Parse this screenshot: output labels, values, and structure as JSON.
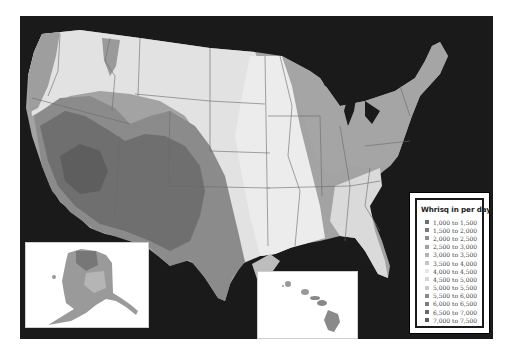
{
  "map": {
    "title": "Whrisq in per day",
    "background_color": "#1a1a1a",
    "insets": [
      {
        "name": "alaska",
        "label": ""
      },
      {
        "name": "hawaii",
        "label": ""
      }
    ]
  },
  "legend": {
    "title": "Whrisq in per day",
    "items": [
      {
        "label": "1,000 to 1,500",
        "color": "#6e6e6e"
      },
      {
        "label": "1,500 to 2,000",
        "color": "#7a7a7a"
      },
      {
        "label": "2,000 to 2,500",
        "color": "#8d8d8d"
      },
      {
        "label": "2,500 to 3,000",
        "color": "#a0a0a0"
      },
      {
        "label": "3,000 to 3,500",
        "color": "#b3b3b3"
      },
      {
        "label": "3,500 to 4,000",
        "color": "#c4c4c4"
      },
      {
        "label": "4,000 to 4,500",
        "color": "#e6e6e6"
      },
      {
        "label": "4,500 to 5,000",
        "color": "#d6d6d6"
      },
      {
        "label": "5,000 to 5,500",
        "color": "#c8c8c8"
      },
      {
        "label": "5,500 to 6,000",
        "color": "#8a8a8a"
      },
      {
        "label": "6,000 to 6,500",
        "color": "#7c7c7c"
      },
      {
        "label": "6,500 to 7,000",
        "color": "#6a6a6a"
      },
      {
        "label": "7,000 to 7,500",
        "color": "#5c5c5c"
      }
    ]
  }
}
